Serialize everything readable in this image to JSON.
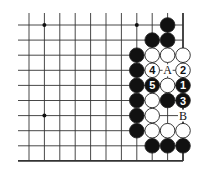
{
  "board": {
    "cols": 11,
    "rows": 10,
    "x0": 29,
    "dx": 15.4,
    "y0": 25,
    "dy": 15.1,
    "left_extend": 18,
    "top_extend": 13,
    "stone_radius": 7.3,
    "star_points": [
      [
        1,
        0
      ],
      [
        7,
        0
      ],
      [
        1,
        6
      ]
    ],
    "stones": [
      {
        "c": 9,
        "r": 0,
        "color": "black",
        "label": ""
      },
      {
        "c": 8,
        "r": 1,
        "color": "black",
        "label": ""
      },
      {
        "c": 9,
        "r": 1,
        "color": "black",
        "label": ""
      },
      {
        "c": 7,
        "r": 2,
        "color": "black",
        "label": ""
      },
      {
        "c": 8,
        "r": 2,
        "color": "white",
        "label": ""
      },
      {
        "c": 9,
        "r": 2,
        "color": "white",
        "label": ""
      },
      {
        "c": 10,
        "r": 2,
        "color": "white",
        "label": ""
      },
      {
        "c": 7,
        "r": 3,
        "color": "black",
        "label": ""
      },
      {
        "c": 8,
        "r": 3,
        "color": "white",
        "label": "4"
      },
      {
        "c": 10,
        "r": 3,
        "color": "white",
        "label": "2"
      },
      {
        "c": 7,
        "r": 4,
        "color": "black",
        "label": ""
      },
      {
        "c": 8,
        "r": 4,
        "color": "black",
        "label": "5"
      },
      {
        "c": 9,
        "r": 4,
        "color": "white",
        "label": ""
      },
      {
        "c": 10,
        "r": 4,
        "color": "black",
        "label": "1"
      },
      {
        "c": 7,
        "r": 5,
        "color": "black",
        "label": ""
      },
      {
        "c": 8,
        "r": 5,
        "color": "white",
        "label": ""
      },
      {
        "c": 9,
        "r": 5,
        "color": "black",
        "label": ""
      },
      {
        "c": 10,
        "r": 5,
        "color": "black",
        "label": "3"
      },
      {
        "c": 7,
        "r": 6,
        "color": "black",
        "label": ""
      },
      {
        "c": 8,
        "r": 6,
        "color": "white",
        "label": ""
      },
      {
        "c": 7,
        "r": 7,
        "color": "black",
        "label": ""
      },
      {
        "c": 8,
        "r": 7,
        "color": "white",
        "label": ""
      },
      {
        "c": 9,
        "r": 7,
        "color": "white",
        "label": ""
      },
      {
        "c": 10,
        "r": 7,
        "color": "white",
        "label": ""
      },
      {
        "c": 8,
        "r": 8,
        "color": "black",
        "label": ""
      },
      {
        "c": 9,
        "r": 8,
        "color": "black",
        "label": ""
      },
      {
        "c": 10,
        "r": 8,
        "color": "black",
        "label": ""
      }
    ],
    "marks": [
      {
        "c": 9,
        "r": 3,
        "label": "A"
      },
      {
        "c": 10,
        "r": 6,
        "label": "B"
      }
    ]
  },
  "colors": {
    "line": "#333333",
    "black": "#111111",
    "white": "#ffffff",
    "stroke": "#222222",
    "bg": "#ffffff"
  }
}
